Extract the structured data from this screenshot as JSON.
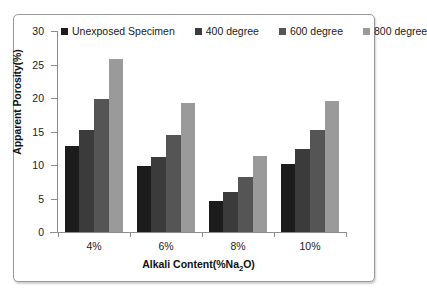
{
  "chart_data": {
    "type": "bar",
    "title": "",
    "xlabel": "Alkali Content(%Na2O)",
    "xlabel_parts": {
      "pre": "Alkali Content(%Na",
      "sub": "2",
      "post": "O)"
    },
    "ylabel": "Apparent Porosity(%)",
    "categories": [
      "4%",
      "6%",
      "8%",
      "10%"
    ],
    "ylim": [
      0,
      30
    ],
    "ytick_values": [
      0,
      5,
      10,
      15,
      20,
      25,
      30
    ],
    "ytick_labels": [
      "0",
      "5",
      "10",
      "15",
      "20",
      "25",
      "30"
    ],
    "grid": false,
    "legend_position": "top",
    "series": [
      {
        "name": "Unexposed Specimen",
        "color": "#1c1c1c",
        "values": [
          12.8,
          9.9,
          4.7,
          10.1
        ]
      },
      {
        "name": "400 degree",
        "color": "#3b3b3b",
        "values": [
          15.2,
          11.2,
          6.0,
          12.4
        ]
      },
      {
        "name": "600 degree",
        "color": "#555555",
        "values": [
          19.9,
          14.5,
          8.2,
          15.3
        ]
      },
      {
        "name": "800 degree",
        "color": "#9a9a9a",
        "values": [
          25.8,
          19.3,
          11.3,
          19.6
        ]
      }
    ]
  },
  "legend": {
    "items": [
      {
        "label": "Unexposed Specimen"
      },
      {
        "label": "400 degree"
      },
      {
        "label": "600 degree"
      },
      {
        "label": "800 degree"
      }
    ]
  },
  "axes": {
    "y_title": "Apparent Porosity(%)",
    "x_title": "Alkali Content(%Na2O)"
  }
}
